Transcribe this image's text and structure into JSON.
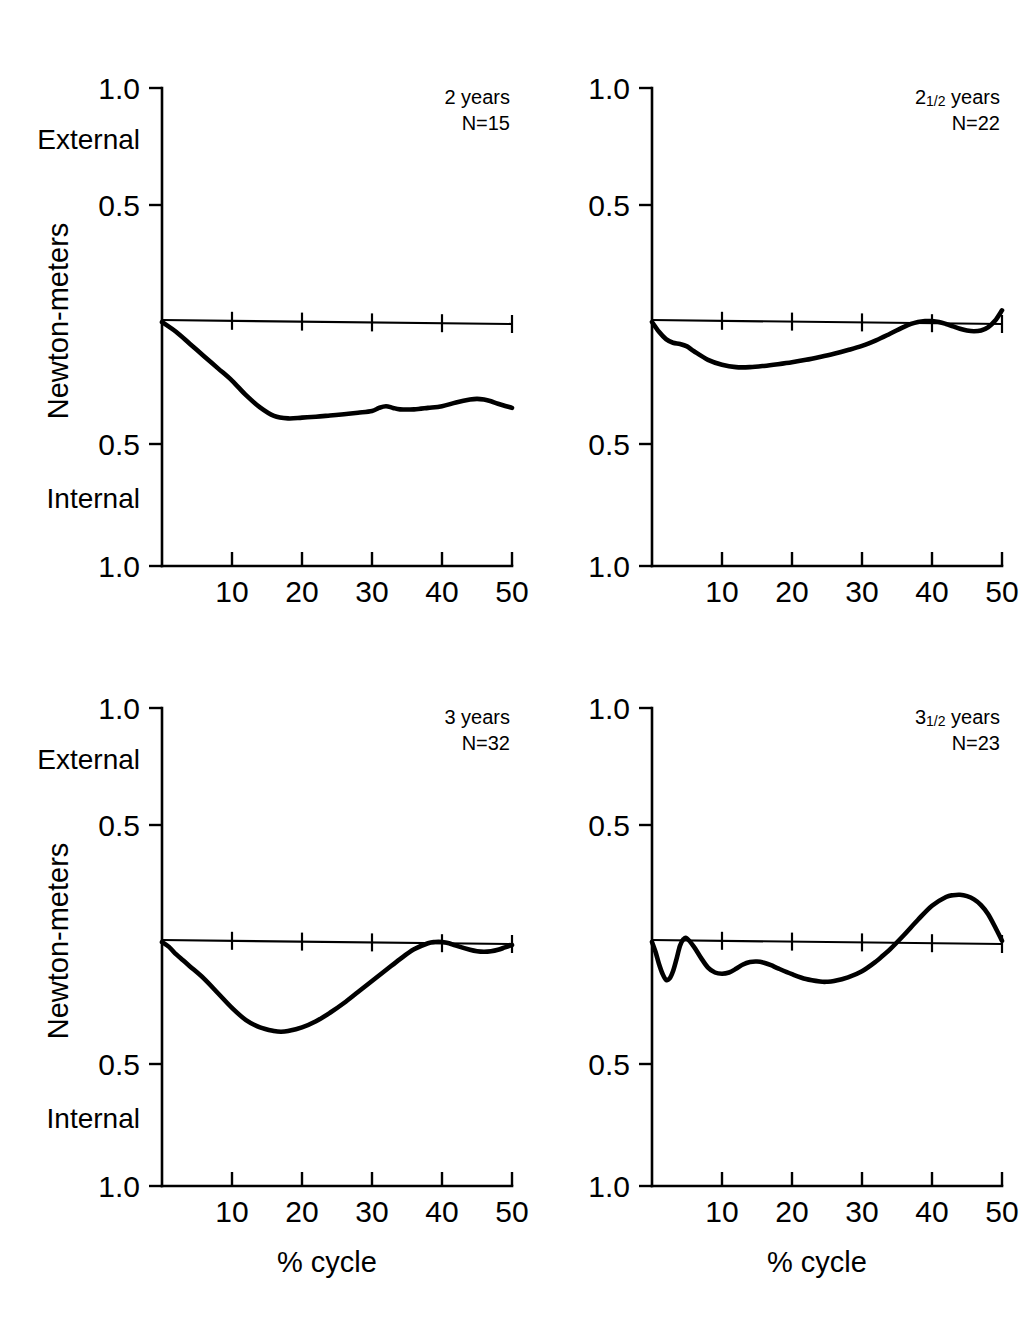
{
  "figure": {
    "axis_title_y": "Newton-meters",
    "axis_title_x": "% cycle",
    "direction_top": "External",
    "direction_bottom": "Internal",
    "y_tick_labels": [
      "1.0",
      "0.5",
      "0.5",
      "1.0"
    ],
    "x_tick_labels": [
      "10",
      "20",
      "30",
      "40",
      "50"
    ]
  },
  "panels": [
    {
      "id": "panel-2-years",
      "age_label": "2",
      "age_fraction": "",
      "age_unit": "years",
      "n_label": "N=15",
      "show_y_labels": true,
      "show_y_title": true,
      "show_direction_labels": true,
      "show_x_title": false
    },
    {
      "id": "panel-2-5-years",
      "age_label": "2",
      "age_fraction": "1/2",
      "age_unit": "years",
      "n_label": "N=22",
      "show_y_labels": true,
      "show_y_title": false,
      "show_direction_labels": false,
      "show_x_title": false
    },
    {
      "id": "panel-3-years",
      "age_label": "3",
      "age_fraction": "",
      "age_unit": "years",
      "n_label": "N=32",
      "show_y_labels": true,
      "show_y_title": true,
      "show_direction_labels": true,
      "show_x_title": true
    },
    {
      "id": "panel-3-5-years",
      "age_label": "3",
      "age_fraction": "1/2",
      "age_unit": "years",
      "n_label": "N=23",
      "show_y_labels": true,
      "show_y_title": false,
      "show_direction_labels": false,
      "show_x_title": true
    }
  ],
  "chart_data": [
    {
      "type": "line",
      "title": "2 years",
      "annotation": "N=15",
      "xlabel": "% cycle",
      "ylabel": "Newton-meters",
      "xlim": [
        0,
        50
      ],
      "ylim": [
        -1.0,
        1.0
      ],
      "ytick_positions": [
        1.0,
        0.5,
        -0.5,
        -1.0
      ],
      "ytick_labels": [
        "1.0",
        "0.5",
        "0.5",
        "1.0"
      ],
      "xticks": [
        10,
        20,
        30,
        40,
        50
      ],
      "grid": false,
      "legend": null,
      "direction_labels": {
        "positive": "External",
        "negative": "Internal"
      },
      "x": [
        0,
        2,
        4,
        6,
        8,
        10,
        12,
        14,
        16,
        18,
        20,
        22,
        24,
        26,
        28,
        30,
        31,
        32,
        33,
        34,
        36,
        38,
        40,
        42,
        44,
        45,
        46,
        47,
        48,
        50
      ],
      "y": [
        0.0,
        -0.04,
        -0.09,
        -0.14,
        -0.19,
        -0.24,
        -0.3,
        -0.35,
        -0.385,
        -0.395,
        -0.392,
        -0.388,
        -0.383,
        -0.378,
        -0.372,
        -0.365,
        -0.352,
        -0.345,
        -0.352,
        -0.358,
        -0.358,
        -0.352,
        -0.345,
        -0.33,
        -0.318,
        -0.315,
        -0.318,
        -0.325,
        -0.335,
        -0.352
      ]
    },
    {
      "type": "line",
      "title": "2 1/2 years",
      "annotation": "N=22",
      "xlabel": "% cycle",
      "ylabel": "Newton-meters",
      "xlim": [
        0,
        50
      ],
      "ylim": [
        -1.0,
        1.0
      ],
      "ytick_positions": [
        1.0,
        0.5,
        -0.5,
        -1.0
      ],
      "ytick_labels": [
        "1.0",
        "0.5",
        "0.5",
        "1.0"
      ],
      "xticks": [
        10,
        20,
        30,
        40,
        50
      ],
      "grid": false,
      "legend": null,
      "direction_labels": {
        "positive": "External",
        "negative": "Internal"
      },
      "x": [
        0,
        1,
        2,
        3,
        4,
        5,
        6,
        8,
        10,
        12,
        14,
        16,
        18,
        20,
        22,
        24,
        26,
        28,
        30,
        32,
        34,
        36,
        37,
        38,
        39,
        40,
        41,
        42,
        43,
        44,
        45,
        46,
        47,
        48,
        49,
        50
      ],
      "y": [
        0.0,
        -0.04,
        -0.07,
        -0.085,
        -0.09,
        -0.1,
        -0.12,
        -0.155,
        -0.175,
        -0.185,
        -0.185,
        -0.18,
        -0.173,
        -0.165,
        -0.155,
        -0.143,
        -0.13,
        -0.115,
        -0.098,
        -0.075,
        -0.048,
        -0.02,
        -0.008,
        0.0,
        0.004,
        0.004,
        0.0,
        -0.008,
        -0.018,
        -0.028,
        -0.035,
        -0.038,
        -0.035,
        -0.022,
        0.005,
        0.05
      ]
    },
    {
      "type": "line",
      "title": "3 years",
      "annotation": "N=32",
      "xlabel": "% cycle",
      "ylabel": "Newton-meters",
      "xlim": [
        0,
        50
      ],
      "ylim": [
        -1.0,
        1.0
      ],
      "ytick_positions": [
        1.0,
        0.5,
        -0.5,
        -1.0
      ],
      "ytick_labels": [
        "1.0",
        "0.5",
        "0.5",
        "1.0"
      ],
      "xticks": [
        10,
        20,
        30,
        40,
        50
      ],
      "grid": false,
      "legend": null,
      "direction_labels": {
        "positive": "External",
        "negative": "Internal"
      },
      "x": [
        0,
        1,
        2,
        3,
        4,
        6,
        8,
        10,
        12,
        14,
        16,
        17,
        18,
        20,
        22,
        24,
        26,
        28,
        30,
        32,
        34,
        36,
        38,
        39,
        40,
        41,
        42,
        44,
        45,
        46,
        47,
        48,
        49,
        50
      ],
      "y": [
        0.0,
        -0.02,
        -0.05,
        -0.075,
        -0.1,
        -0.15,
        -0.21,
        -0.27,
        -0.32,
        -0.35,
        -0.365,
        -0.368,
        -0.365,
        -0.35,
        -0.325,
        -0.29,
        -0.25,
        -0.205,
        -0.16,
        -0.115,
        -0.07,
        -0.03,
        -0.005,
        0.0,
        0.0,
        -0.005,
        -0.015,
        -0.032,
        -0.038,
        -0.04,
        -0.038,
        -0.032,
        -0.022,
        -0.012
      ]
    },
    {
      "type": "line",
      "title": "3 1/2 years",
      "annotation": "N=23",
      "xlabel": "% cycle",
      "ylabel": "Newton-meters",
      "xlim": [
        0,
        50
      ],
      "ylim": [
        -1.0,
        1.0
      ],
      "ytick_positions": [
        1.0,
        0.5,
        -0.5,
        -1.0
      ],
      "ytick_labels": [
        "1.0",
        "0.5",
        "0.5",
        "1.0"
      ],
      "xticks": [
        10,
        20,
        30,
        40,
        50
      ],
      "grid": false,
      "legend": null,
      "direction_labels": {
        "positive": "External",
        "negative": "Internal"
      },
      "x": [
        0,
        0.5,
        1,
        1.5,
        2,
        2.5,
        3,
        3.5,
        4,
        4.5,
        5,
        6,
        7,
        8,
        9,
        10,
        11,
        12,
        13,
        14,
        15,
        16,
        17,
        18,
        20,
        22,
        24,
        25,
        26,
        28,
        30,
        32,
        33,
        34,
        36,
        38,
        40,
        42,
        43,
        44,
        45,
        46,
        47,
        48,
        49,
        50
      ],
      "y": [
        0.0,
        -0.04,
        -0.09,
        -0.13,
        -0.155,
        -0.15,
        -0.12,
        -0.07,
        -0.015,
        0.012,
        0.015,
        -0.02,
        -0.065,
        -0.105,
        -0.125,
        -0.13,
        -0.125,
        -0.11,
        -0.092,
        -0.082,
        -0.08,
        -0.085,
        -0.095,
        -0.108,
        -0.132,
        -0.152,
        -0.162,
        -0.163,
        -0.16,
        -0.145,
        -0.12,
        -0.08,
        -0.055,
        -0.03,
        0.03,
        0.095,
        0.155,
        0.192,
        0.2,
        0.202,
        0.196,
        0.182,
        0.158,
        0.12,
        0.065,
        0.005
      ]
    }
  ]
}
